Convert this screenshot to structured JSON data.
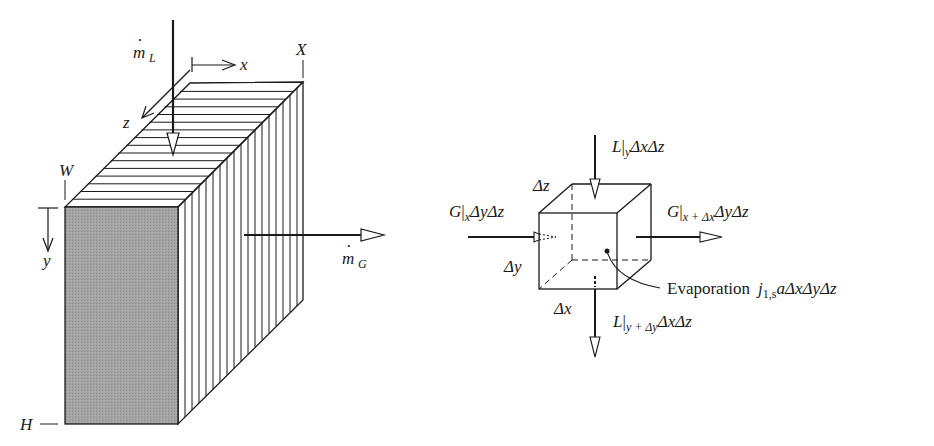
{
  "figure": {
    "slab": {
      "labels": {
        "liquid_flow": {
          "base": "m",
          "sub": "L",
          "dot": "·"
        },
        "gas_flow": {
          "base": "m",
          "sub": "G",
          "dot": "·"
        },
        "x_axis": "x",
        "z_axis": "z",
        "y_axis": "y",
        "corner_X": "X",
        "corner_W": "W",
        "corner_H": "H"
      },
      "colors": {
        "front_face": "#9e9e9e",
        "stroke": "#1a1a1a",
        "arrowhead_fill": "#ffffff"
      }
    },
    "control_volume": {
      "top_flux": {
        "main": "L",
        "bar": "|",
        "sub": "y",
        "rest": "ΔxΔz"
      },
      "bottom_flux": {
        "main": "L",
        "bar": "|",
        "sub": "y + Δy",
        "rest": "ΔxΔz"
      },
      "left_flux": {
        "main": "G",
        "bar": "|",
        "sub": "x",
        "rest": "ΔyΔz"
      },
      "right_flux": {
        "main": "G",
        "bar": "|",
        "sub": "x + Δx",
        "rest": "ΔyΔz"
      },
      "dz": "Δz",
      "dy": "Δy",
      "dx": "Δx",
      "evaporation": {
        "word": "Evaporation",
        "j": "j",
        "sub": "1,s",
        "rest": "aΔxΔyΔz"
      }
    }
  }
}
